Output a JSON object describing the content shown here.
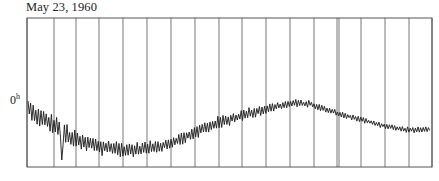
{
  "chart_data": {
    "type": "line",
    "title": "May 23, 1960",
    "ylabel": "0",
    "ylabel_superscript": "h",
    "xlabel": "",
    "grid": true,
    "legend": null,
    "frame": {
      "left": 27,
      "right": 432,
      "top": 18,
      "bottom": 167
    },
    "vertical_gridlines_x": [
      27,
      54,
      76,
      99,
      123,
      147,
      171,
      195,
      219,
      242,
      266,
      290,
      314,
      337,
      339,
      361,
      385,
      409,
      432
    ],
    "series": [
      {
        "name": "trace",
        "color": "#1a1a1a",
        "baseline_points": [
          [
            28,
            108
          ],
          [
            40,
            118
          ],
          [
            55,
            125
          ],
          [
            70,
            138
          ],
          [
            85,
            143
          ],
          [
            100,
            147
          ],
          [
            115,
            149
          ],
          [
            130,
            150
          ],
          [
            145,
            148
          ],
          [
            160,
            146
          ],
          [
            175,
            141
          ],
          [
            190,
            135
          ],
          [
            205,
            128
          ],
          [
            220,
            122
          ],
          [
            235,
            118
          ],
          [
            250,
            113
          ],
          [
            265,
            109
          ],
          [
            280,
            106
          ],
          [
            295,
            103
          ],
          [
            310,
            104
          ],
          [
            325,
            109
          ],
          [
            340,
            114
          ],
          [
            355,
            118
          ],
          [
            370,
            122
          ],
          [
            385,
            126
          ],
          [
            400,
            129
          ],
          [
            415,
            130
          ],
          [
            431,
            129
          ]
        ],
        "noise_amplitude_points": [
          [
            28,
            9
          ],
          [
            55,
            10
          ],
          [
            62,
            14
          ],
          [
            80,
            8
          ],
          [
            110,
            9
          ],
          [
            140,
            7
          ],
          [
            170,
            6
          ],
          [
            210,
            7
          ],
          [
            250,
            6
          ],
          [
            290,
            4
          ],
          [
            330,
            3
          ],
          [
            370,
            3
          ],
          [
            431,
            3
          ]
        ],
        "spike": {
          "x": 62,
          "y_low": 160
        }
      }
    ]
  }
}
